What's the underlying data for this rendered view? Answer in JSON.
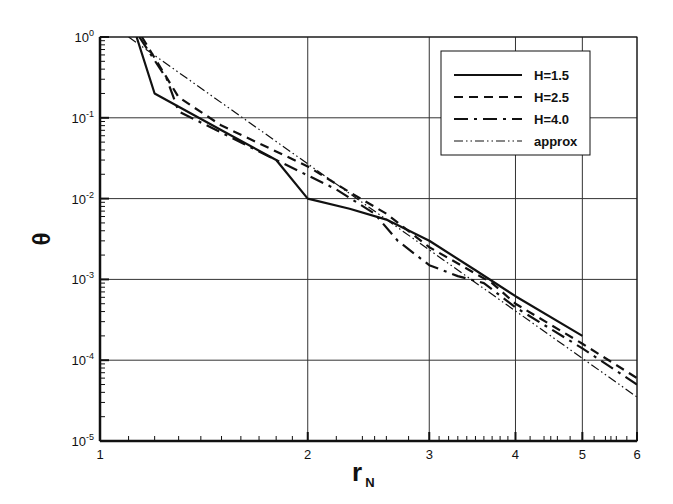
{
  "chart_data": {
    "type": "line",
    "title": "",
    "xlabel": "r",
    "xlabel_sub": "N",
    "ylabel": "θ",
    "xscale": "log",
    "yscale": "log",
    "xlim": [
      1,
      6
    ],
    "ylim": [
      1e-05,
      1
    ],
    "grid": true,
    "legend_position": "upper right",
    "x_ticks": [
      1,
      2,
      3,
      4,
      5,
      6
    ],
    "x_tick_labels": [
      "1",
      "2",
      "3",
      "4",
      "5",
      "6"
    ],
    "y_ticks": [
      1,
      0.1,
      0.01,
      0.001,
      0.0001,
      1e-05
    ],
    "y_tick_labels": [
      {
        "base": "10",
        "exp": "0"
      },
      {
        "base": "10",
        "exp": "-1"
      },
      {
        "base": "10",
        "exp": "-2"
      },
      {
        "base": "10",
        "exp": "-3"
      },
      {
        "base": "10",
        "exp": "-4"
      },
      {
        "base": "10",
        "exp": "-5"
      }
    ],
    "series": [
      {
        "name": "H=1.5",
        "style": "solid",
        "x": [
          1.13,
          1.2,
          1.5,
          1.8,
          2.0,
          2.3,
          2.6,
          3.0,
          3.5,
          4.0,
          5.0
        ],
        "y": [
          1.0,
          0.2,
          0.07,
          0.03,
          0.01,
          0.0075,
          0.0055,
          0.003,
          0.0013,
          0.00062,
          0.0002
        ]
      },
      {
        "name": "H=2.5",
        "style": "dashed",
        "x": [
          1.15,
          1.3,
          1.5,
          2.0,
          2.3,
          2.6,
          3.0,
          3.7,
          4.0,
          5.0,
          6.0
        ],
        "y": [
          1.0,
          0.18,
          0.08,
          0.025,
          0.012,
          0.0065,
          0.0025,
          0.0009,
          0.0005,
          0.00016,
          6e-05
        ]
      },
      {
        "name": "H=4.0",
        "style": "dashdot",
        "x": [
          1.14,
          1.25,
          1.3,
          1.8,
          2.2,
          2.5,
          2.7,
          3.0,
          3.3,
          3.6,
          4.0,
          5.0,
          6.0
        ],
        "y": [
          1.0,
          0.3,
          0.12,
          0.03,
          0.013,
          0.0065,
          0.003,
          0.0015,
          0.0011,
          0.0009,
          0.00045,
          0.00014,
          5e-05
        ]
      },
      {
        "name": "approx",
        "style": "dashdotdot",
        "x": [
          1.1,
          6.0
        ],
        "y": [
          1.0,
          3.5e-05
        ]
      }
    ]
  }
}
